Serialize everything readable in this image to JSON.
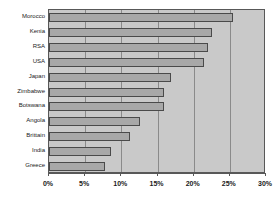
{
  "chart_data": {
    "type": "bar",
    "orientation": "horizontal",
    "title": "",
    "subtitle": "",
    "xlabel": "",
    "ylabel": "",
    "categories": [
      "Morocco",
      "Kenia",
      "RSA",
      "USA",
      "Japan",
      "Zimbabwe",
      "Botswana",
      "Angola",
      "Brittain",
      "India",
      "Greece"
    ],
    "values": [
      25.4,
      22.5,
      22.0,
      21.4,
      16.9,
      15.9,
      15.9,
      12.6,
      11.2,
      8.6,
      7.7
    ],
    "value_unit": "%",
    "xlim": [
      0,
      30
    ],
    "xticks": [
      0,
      5,
      10,
      15,
      20,
      25,
      30
    ],
    "xtick_labels": [
      "0%",
      "5%",
      "10%",
      "15%",
      "20%",
      "25%",
      "30%"
    ],
    "grid": true,
    "grid_axis": "x",
    "legend": false,
    "legend_position": "none",
    "series": [
      {
        "name": "",
        "values": [
          25.4,
          22.5,
          22.0,
          21.4,
          16.9,
          15.9,
          15.9,
          12.6,
          11.2,
          8.6,
          7.7
        ]
      }
    ],
    "colors": {
      "bar_fill": "#a8a8a8",
      "bar_border": "#4a4a4a",
      "plot_background": "#c9c9c9",
      "gridline": "#8a8a8a",
      "axis": "#585858",
      "text": "#1a1a1a",
      "page_background": "#ffffff"
    }
  }
}
